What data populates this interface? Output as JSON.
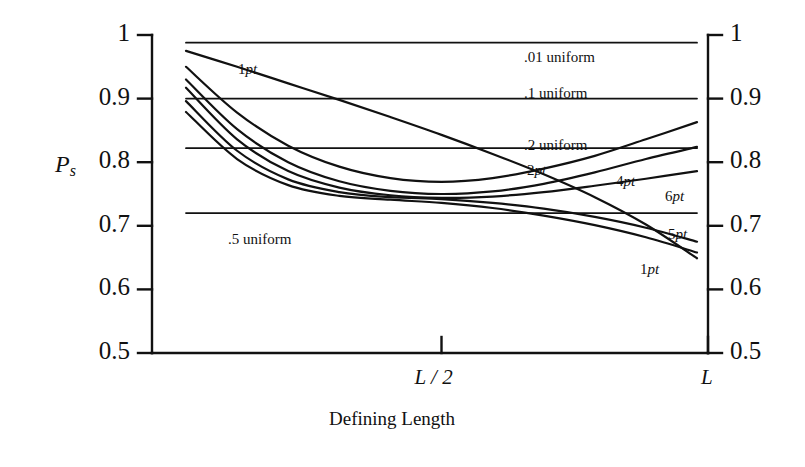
{
  "chart_data": {
    "type": "line",
    "title": "",
    "xlabel": "Defining Length",
    "ylabel": "P_s",
    "ylabel_main": "P",
    "ylabel_sub": "s",
    "ylim": [
      0.5,
      1.0
    ],
    "xlim": [
      0,
      1
    ],
    "grid": false,
    "legend_position": "inline-annotations",
    "y_ticks": [
      {
        "value": 1.0,
        "label": "1"
      },
      {
        "value": 0.9,
        "label": "0.9"
      },
      {
        "value": 0.8,
        "label": "0.8"
      },
      {
        "value": 0.7,
        "label": "0.7"
      },
      {
        "value": 0.6,
        "label": "0.6"
      },
      {
        "value": 0.5,
        "label": "0.5"
      }
    ],
    "y_ticks_right": [
      {
        "value": 1.0,
        "label": "1"
      },
      {
        "value": 0.9,
        "label": "0.9"
      },
      {
        "value": 0.8,
        "label": "0.8"
      },
      {
        "value": 0.7,
        "label": "0.7"
      },
      {
        "value": 0.6,
        "label": "0.6"
      },
      {
        "value": 0.5,
        "label": "0.5"
      }
    ],
    "x_ticks": [
      {
        "value": 0.5,
        "label": "L / 2"
      },
      {
        "value": 1.0,
        "label": "L"
      }
    ],
    "series": [
      {
        "name": ".01 uniform",
        "label": ".01 uniform",
        "kind": "horizontal",
        "x": [
          0.0,
          1.0
        ],
        "values": [
          0.988,
          0.988
        ]
      },
      {
        "name": ".1 uniform",
        "label": ".1 uniform",
        "kind": "horizontal",
        "x": [
          0.0,
          1.0
        ],
        "values": [
          0.9,
          0.9
        ]
      },
      {
        "name": ".2 uniform",
        "label": ".2 uniform",
        "kind": "horizontal",
        "x": [
          0.0,
          1.0
        ],
        "values": [
          0.822,
          0.822
        ]
      },
      {
        "name": ".5 uniform",
        "label": ".5 uniform",
        "kind": "horizontal",
        "x": [
          0.0,
          1.0
        ],
        "values": [
          0.72,
          0.72
        ]
      },
      {
        "name": "1pt",
        "label": "1pt",
        "kind": "curve",
        "x": [
          0.0,
          0.1,
          0.2,
          0.3,
          0.4,
          0.5,
          0.6,
          0.7,
          0.8,
          0.9,
          1.0
        ],
        "values": [
          0.975,
          0.95,
          0.924,
          0.898,
          0.871,
          0.843,
          0.813,
          0.781,
          0.745,
          0.702,
          0.649
        ]
      },
      {
        "name": "2pt",
        "label": "2pt",
        "kind": "curve",
        "x": [
          0.0,
          0.1,
          0.2,
          0.3,
          0.4,
          0.5,
          0.6,
          0.7,
          0.8,
          0.9,
          1.0
        ],
        "values": [
          0.95,
          0.878,
          0.826,
          0.793,
          0.775,
          0.769,
          0.775,
          0.79,
          0.81,
          0.836,
          0.863
        ]
      },
      {
        "name": "4pt",
        "label": "4pt",
        "kind": "curve",
        "x": [
          0.0,
          0.1,
          0.2,
          0.3,
          0.4,
          0.5,
          0.6,
          0.7,
          0.8,
          0.9,
          1.0
        ],
        "values": [
          0.93,
          0.852,
          0.8,
          0.77,
          0.755,
          0.75,
          0.754,
          0.766,
          0.784,
          0.805,
          0.824
        ]
      },
      {
        "name": "6pt",
        "label": "6pt",
        "kind": "curve",
        "x": [
          0.0,
          0.1,
          0.2,
          0.3,
          0.4,
          0.5,
          0.6,
          0.7,
          0.8,
          0.9,
          1.0
        ],
        "values": [
          0.917,
          0.836,
          0.786,
          0.76,
          0.748,
          0.744,
          0.746,
          0.753,
          0.763,
          0.774,
          0.786
        ]
      },
      {
        "name": "5pt",
        "label": "5pt",
        "kind": "curve",
        "x": [
          0.0,
          0.1,
          0.2,
          0.3,
          0.4,
          0.5,
          0.6,
          0.7,
          0.8,
          0.9,
          1.0
        ],
        "values": [
          0.896,
          0.818,
          0.773,
          0.753,
          0.745,
          0.742,
          0.736,
          0.727,
          0.714,
          0.697,
          0.675
        ]
      },
      {
        "name": "1pt-lower",
        "label": "1pt",
        "kind": "curve",
        "x": [
          0.0,
          0.1,
          0.2,
          0.3,
          0.4,
          0.5,
          0.6,
          0.7,
          0.8,
          0.9,
          1.0
        ],
        "values": [
          0.879,
          0.805,
          0.764,
          0.747,
          0.741,
          0.736,
          0.728,
          0.716,
          0.701,
          0.682,
          0.658
        ]
      }
    ],
    "annotations": [
      {
        "text": "1pt",
        "x_px": 238,
        "y_px": 62,
        "italic_from": 1
      },
      {
        "text": ".01 uniform",
        "x_px": 524,
        "y_px": 50,
        "italic_from": -1
      },
      {
        "text": ".1 uniform",
        "x_px": 524,
        "y_px": 86,
        "italic_from": -1
      },
      {
        "text": ".2 uniform",
        "x_px": 524,
        "y_px": 138,
        "italic_from": -1
      },
      {
        "text": "2pt",
        "x_px": 527,
        "y_px": 163,
        "italic_from": 1
      },
      {
        "text": "4pt",
        "x_px": 616,
        "y_px": 174,
        "italic_from": 1
      },
      {
        "text": "6pt",
        "x_px": 665,
        "y_px": 189,
        "italic_from": 1
      },
      {
        "text": "5pt",
        "x_px": 668,
        "y_px": 227,
        "italic_from": 1
      },
      {
        "text": ".5 uniform",
        "x_px": 228,
        "y_px": 232,
        "italic_from": -1
      },
      {
        "text": "1pt",
        "x_px": 640,
        "y_px": 262,
        "italic_from": 1
      }
    ]
  },
  "axes": {
    "y_axis_title_main": "P",
    "y_axis_title_sub": "s",
    "x_axis_caption": "Defining Length",
    "x_tick_mid": "L / 2",
    "x_tick_end": "L"
  },
  "colors": {
    "ink": "#111111",
    "background": "#ffffff"
  }
}
